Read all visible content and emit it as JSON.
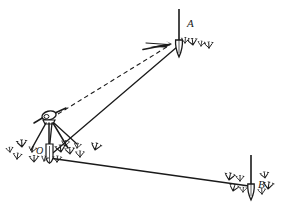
{
  "figure": {
    "type": "surveying-angle-measurement-diagram",
    "title": "",
    "caption": "",
    "background_color": "#ffffff",
    "ink_color": "#1a1a1a",
    "width": 286,
    "height": 219,
    "points": [
      {
        "id": "A",
        "label": "A",
        "role": "target-station-ranging-pole",
        "x": 179,
        "y": 44,
        "label_x": 187,
        "label_y": 18,
        "pole_top_x": 179,
        "pole_top_y": 9,
        "pole_bottom_x": 179,
        "pole_bottom_y": 57
      },
      {
        "id": "O",
        "label": "O",
        "role": "instrument-station-theodolite-on-tripod",
        "x": 50,
        "y": 155,
        "label_x": 36,
        "label_y": 146,
        "instrument_x": 49,
        "instrument_y": 117
      },
      {
        "id": "B",
        "label": "B",
        "role": "target-station-ranging-pole",
        "x": 251,
        "y": 185,
        "label_x": 258,
        "label_y": 179,
        "pole_top_x": 251,
        "pole_top_y": 155,
        "pole_bottom_x": 251,
        "pole_bottom_y": 200
      }
    ],
    "lines": [
      {
        "id": "sight-line-O-to-A",
        "from": "instrument-O",
        "to": "A",
        "style": "dashed",
        "description": "line of sight from theodolite telescope to ranging pole A",
        "x1": 58,
        "y1": 114,
        "x2": 172,
        "y2": 45
      },
      {
        "id": "ground-line-O-to-A",
        "from": "O",
        "to": "A",
        "style": "solid",
        "description": "ground line from station O to station A",
        "x1": 47,
        "y1": 158,
        "x2": 177,
        "y2": 47
      },
      {
        "id": "ground-line-O-to-B",
        "from": "O",
        "to": "B",
        "style": "solid",
        "description": "ground line from station O to station B",
        "x1": 49,
        "y1": 158,
        "x2": 249,
        "y2": 186
      }
    ],
    "arrow_markers": [
      {
        "id": "arrow-at-A",
        "points_to": "A",
        "x": 168,
        "y": 44
      }
    ],
    "grass_tufts": [
      {
        "x": 10,
        "y": 152
      },
      {
        "x": 17,
        "y": 159
      },
      {
        "x": 22,
        "y": 147
      },
      {
        "x": 32,
        "y": 152
      },
      {
        "x": 34,
        "y": 162
      },
      {
        "x": 44,
        "y": 161
      },
      {
        "x": 57,
        "y": 162
      },
      {
        "x": 61,
        "y": 152
      },
      {
        "x": 65,
        "y": 146
      },
      {
        "x": 70,
        "y": 154
      },
      {
        "x": 77,
        "y": 148
      },
      {
        "x": 80,
        "y": 157
      },
      {
        "x": 95,
        "y": 150
      },
      {
        "x": 185,
        "y": 43
      },
      {
        "x": 193,
        "y": 45
      },
      {
        "x": 201,
        "y": 46
      },
      {
        "x": 209,
        "y": 48
      },
      {
        "x": 229,
        "y": 180
      },
      {
        "x": 240,
        "y": 181
      },
      {
        "x": 233,
        "y": 191
      },
      {
        "x": 243,
        "y": 192
      },
      {
        "x": 265,
        "y": 178
      },
      {
        "x": 268,
        "y": 189
      },
      {
        "x": 262,
        "y": 194
      }
    ]
  }
}
